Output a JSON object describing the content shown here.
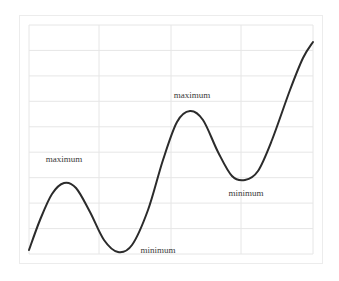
{
  "chart_data": {
    "type": "line",
    "title": "",
    "xlabel": "",
    "ylabel": "",
    "grid": true,
    "legend": null,
    "plot_area_px": {
      "left": 29,
      "top": 25,
      "right": 313,
      "bottom": 254
    },
    "x_gridlines_px": [
      29,
      99,
      171,
      241,
      313
    ],
    "y_gridlines_px": [
      25,
      50.4,
      75.9,
      101.3,
      126.8,
      152.2,
      177.7,
      203.1,
      228.6,
      254
    ],
    "series": [
      {
        "name": "curve",
        "color": "#2b2b2b",
        "points_px": [
          [
            29,
            250
          ],
          [
            40,
            220
          ],
          [
            52,
            194
          ],
          [
            64,
            183
          ],
          [
            76,
            188
          ],
          [
            90,
            212
          ],
          [
            104,
            240
          ],
          [
            118,
            252
          ],
          [
            132,
            245
          ],
          [
            148,
            210
          ],
          [
            163,
            160
          ],
          [
            177,
            122
          ],
          [
            190,
            111
          ],
          [
            203,
            120
          ],
          [
            218,
            152
          ],
          [
            232,
            176
          ],
          [
            245,
            180
          ],
          [
            258,
            171
          ],
          [
            272,
            140
          ],
          [
            290,
            90
          ],
          [
            303,
            58
          ],
          [
            313,
            42
          ]
        ]
      }
    ],
    "annotations": [
      {
        "text": "maximum",
        "x": 64,
        "y": 159
      },
      {
        "text": "minimum",
        "x": 158,
        "y": 250
      },
      {
        "text": "maximum",
        "x": 192,
        "y": 95
      },
      {
        "text": "minimum",
        "x": 246,
        "y": 193
      }
    ],
    "colors": {
      "grid": "#e6e6e6",
      "frame": "#ececec",
      "line": "#2b2b2b",
      "text": "#3a3a3a"
    }
  },
  "labels": {
    "max1": "maximum",
    "min1": "minimum",
    "max2": "maximum",
    "min2": "minimum"
  }
}
